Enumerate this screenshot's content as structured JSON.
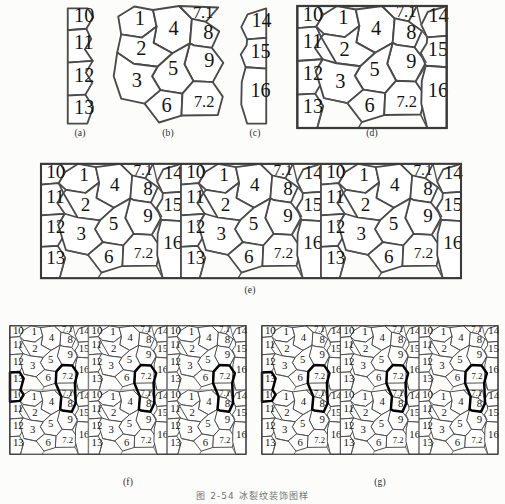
{
  "figure": {
    "caption_number": "图 2-54",
    "caption_text": "冰裂纹装饰图样",
    "caption_full": "图 2-54   冰裂纹装饰图样"
  },
  "panels": [
    {
      "id": "a",
      "label": "(a)",
      "kind": "left-strip",
      "description": "narrow vertical strip, straight left edge, jagged right edge",
      "cells": [
        "10",
        "11",
        "12",
        "13"
      ]
    },
    {
      "id": "b",
      "label": "(b)",
      "kind": "core-tile",
      "description": "central repeating polygon cluster with jagged left and right edges",
      "cells": [
        "1",
        "2",
        "3",
        "4",
        "5",
        "6",
        "7.1",
        "7.2",
        "8",
        "9"
      ]
    },
    {
      "id": "c",
      "label": "(c)",
      "kind": "right-strip",
      "description": "narrow vertical strip, jagged left edge, straight right edge",
      "cells": [
        "14",
        "15",
        "16"
      ]
    },
    {
      "id": "d",
      "label": "(d)",
      "kind": "unit-tile",
      "description": "assembled rectangular unit tile = (a)+(b)+(c)",
      "cells": [
        "10",
        "11",
        "12",
        "13",
        "1",
        "2",
        "3",
        "4",
        "5",
        "6",
        "7.1",
        "7.2",
        "8",
        "9",
        "14",
        "15",
        "16"
      ]
    },
    {
      "id": "e",
      "label": "(e)",
      "kind": "row-repeat",
      "description": "unit tile repeated three times horizontally into one band",
      "repeat_x": 3,
      "repeat_y": 1
    },
    {
      "id": "f",
      "label": "(f)",
      "kind": "grid-repeat-seams",
      "description": "3x2 tiling with grey seam lines visible; merged boundary cells 7.2/7.1 and 13/10 outlined in bold",
      "repeat_x": 3,
      "repeat_y": 2,
      "highlighted_cells": [
        "7.2",
        "7.1",
        "13",
        "10"
      ]
    },
    {
      "id": "g",
      "label": "(g)",
      "kind": "grid-repeat-clean",
      "description": "3x2 tiling with seams removed; merged boundary cells 7.2/7.1 and 13/10 outlined in bold",
      "repeat_x": 3,
      "repeat_y": 2,
      "highlighted_cells": [
        "7.2",
        "7.1",
        "13",
        "10"
      ]
    }
  ],
  "tile": {
    "width": 60,
    "height": 49,
    "left_strip_cells": [
      {
        "n": "10",
        "x": 4.6,
        "y": 6.5
      },
      {
        "n": "11",
        "x": 4.6,
        "y": 17.0
      },
      {
        "n": "12",
        "x": 4.6,
        "y": 30.0
      },
      {
        "n": "13",
        "x": 4.6,
        "y": 43.0
      }
    ],
    "core_cells": [
      {
        "n": "1",
        "x": 17.5,
        "y": 7.5
      },
      {
        "n": "4",
        "x": 30.0,
        "y": 12.0
      },
      {
        "n": "7.1",
        "x": 42.5,
        "y": 5.8
      },
      {
        "n": "8",
        "x": 45.5,
        "y": 14.5
      },
      {
        "n": "2",
        "x": 18.5,
        "y": 20.5
      },
      {
        "n": "9",
        "x": 43.0,
        "y": 26.0
      },
      {
        "n": "5",
        "x": 29.0,
        "y": 29.5
      },
      {
        "n": "3",
        "x": 17.0,
        "y": 34.5
      },
      {
        "n": "6",
        "x": 28.5,
        "y": 43.0
      },
      {
        "n": "7.2",
        "x": 42.0,
        "y": 41.0
      }
    ],
    "right_strip_cells": [
      {
        "n": "14",
        "x": 55.0,
        "y": 7.0
      },
      {
        "n": "15",
        "x": 55.0,
        "y": 21.0
      },
      {
        "n": "16",
        "x": 55.0,
        "y": 37.5
      }
    ]
  },
  "colors": {
    "background": "#fcfcfb",
    "cell_fill": "#ffffff",
    "edge_stroke": "#4a4a4a",
    "frame_stroke": "#3a3a3a",
    "highlight_stroke": "#000000",
    "seam_stroke": "#8a8a8a",
    "text": "#141414"
  }
}
